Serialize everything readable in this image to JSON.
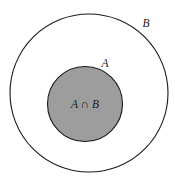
{
  "diagram": {
    "type": "venn-subset",
    "background_color": "#ffffff",
    "outer_circle": {
      "label": "B",
      "name": "set-b",
      "center_x": 89,
      "center_y": 93,
      "radius": 79,
      "fill": "#ffffff",
      "stroke": "#1a1a1a",
      "stroke_width": 1.1,
      "label_x": 146,
      "label_y": 27
    },
    "inner_circle": {
      "label": "A",
      "name": "set-a",
      "center_x": 85,
      "center_y": 104,
      "radius": 37.5,
      "fill": "#9d9d9d",
      "stroke": "#1a1a1a",
      "stroke_width": 1.1,
      "label_x": 105,
      "label_y": 67
    },
    "intersection": {
      "label": "A ∩ B",
      "name": "intersection-region",
      "fill": "#9d9d9d",
      "label_x": 85,
      "label_y": 108
    }
  }
}
